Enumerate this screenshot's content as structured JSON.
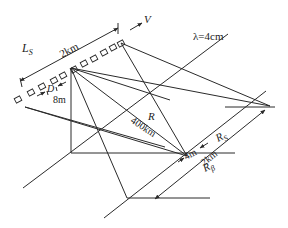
{
  "diagram": {
    "labels": {
      "synthetic_aperture": "L",
      "synthetic_aperture_sub": "S",
      "aperture_length": "2km",
      "velocity": "V",
      "wavelength": "λ=4cm",
      "antenna_size_symbol": "D",
      "antenna_size": "8m",
      "range_symbol": "R",
      "range_value": "400km",
      "azimuth_resolution": "4m",
      "swath_symbol": "R",
      "swath_sub": "S",
      "swath_value": "2km",
      "beam_symbol": "R",
      "beam_sub": "β"
    },
    "colors": {
      "line": "#2a2a2a",
      "background": "#ffffff"
    }
  }
}
